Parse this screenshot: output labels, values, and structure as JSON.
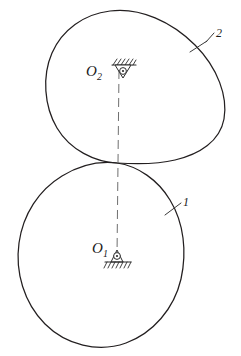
{
  "figure": {
    "background_color": "#ffffff",
    "outline_color": "#231f20",
    "centerline_color": "#6f6f6f",
    "width": 241,
    "height": 356
  },
  "labels": {
    "upper_center": "O",
    "upper_center_sub": "2",
    "lower_center": "O",
    "lower_center_sub": "1",
    "part_upper": "2",
    "part_lower": "1"
  },
  "icons": {
    "upper_support": "hanging-pin-support-icon",
    "lower_support": "fixed-pin-support-icon",
    "upper_pivot": "pivot-point-icon",
    "lower_pivot": "pivot-point-icon",
    "centerline": "dashed-centerline-icon",
    "leader_upper": "leader-line-icon",
    "leader_lower": "leader-line-icon"
  },
  "geometry": {
    "upper_body_center": [
      118,
      76
    ],
    "lower_body_center": [
      114,
      254
    ],
    "contact_point": [
      117,
      163
    ],
    "upper_body_label_pos": [
      216,
      37
    ],
    "lower_body_label_pos": [
      184,
      206
    ]
  }
}
